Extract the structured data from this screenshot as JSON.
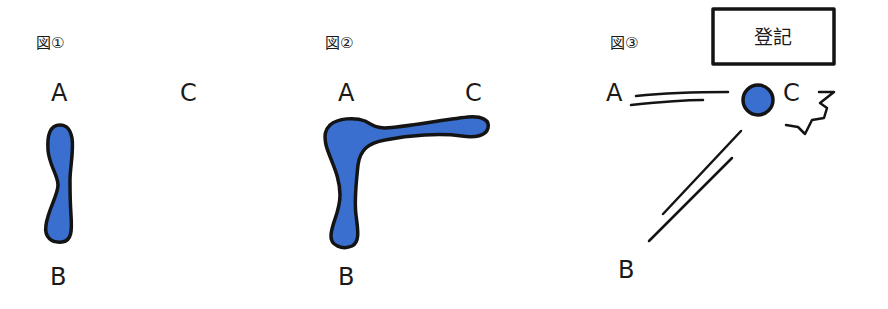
{
  "colors": {
    "blob_fill": "#3a6fcf",
    "ink": "#141414",
    "background": "#ffffff"
  },
  "panels": [
    {
      "figure_label": "図①",
      "points": {
        "a": "A",
        "b": "B",
        "c": "C"
      },
      "description": "vertical blob connecting A and B"
    },
    {
      "figure_label": "図②",
      "points": {
        "a": "A",
        "b": "B",
        "c": "C"
      },
      "description": "L-shaped blob connecting B, A and C"
    },
    {
      "figure_label": "図③",
      "points": {
        "a": "A",
        "b": "B",
        "c": "C"
      },
      "box_label": "登記",
      "description": "ball at C with motion lines from A and B and an impact burst"
    }
  ]
}
